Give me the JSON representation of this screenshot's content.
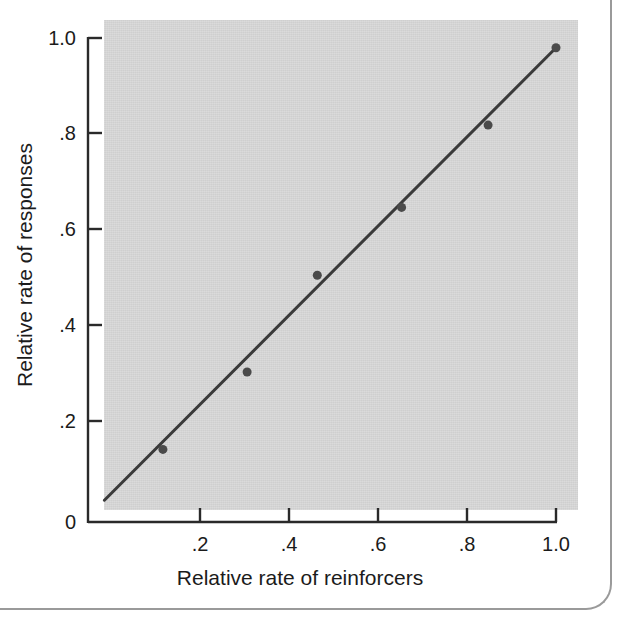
{
  "figure": {
    "name": "relative-rate-matching-scatter",
    "top_caption_sliver": "",
    "background_color": "#ffffff",
    "plot_background_color": "#cfcfcf",
    "ink_color": "#3a3a3a",
    "border_color": "#9a9a9a"
  },
  "chart_data": {
    "type": "scatter",
    "title": "",
    "subtitle": "",
    "xlabel": "Relative rate of reinforcers",
    "ylabel": "Relative rate of responses",
    "xlim": [
      0,
      1.06
    ],
    "ylim": [
      0,
      1.06
    ],
    "xticks": [
      0.2,
      0.4,
      0.6,
      0.8,
      1.0
    ],
    "xticklabels": [
      ".2",
      ".4",
      ".6",
      ".8",
      "1.0"
    ],
    "yticks": [
      0.2,
      0.4,
      0.6,
      0.8,
      1.0
    ],
    "yticklabels": [
      ".2",
      ".4",
      ".6",
      ".8",
      "1.0"
    ],
    "origin_label": "0",
    "grid": false,
    "legend": null,
    "annotations": [],
    "series": [
      {
        "name": "Observed relative response rates",
        "marker": "filled-circle",
        "marker_color": "#4a4a4a",
        "marker_size": 9,
        "x": [
          0.16,
          0.34,
          0.49,
          0.67,
          0.855,
          1.0
        ],
        "y": [
          0.15,
          0.31,
          0.51,
          0.65,
          0.82,
          0.98
        ]
      },
      {
        "name": "Matching line (fitted)",
        "type": "line",
        "line_color": "#3a3a3a",
        "line_width": 3,
        "x": [
          0.035,
          1.0
        ],
        "y": [
          0.045,
          0.98
        ]
      }
    ]
  },
  "axes": {
    "x_axis_label": "Relative rate of reinforcers",
    "y_axis_label": "Relative rate of responses",
    "x_tick_labels": [
      ".2",
      ".4",
      ".6",
      ".8",
      "1.0"
    ],
    "y_tick_labels": [
      "1.0",
      ".8",
      ".6",
      ".4",
      ".2"
    ],
    "origin_tick_label": "0"
  }
}
